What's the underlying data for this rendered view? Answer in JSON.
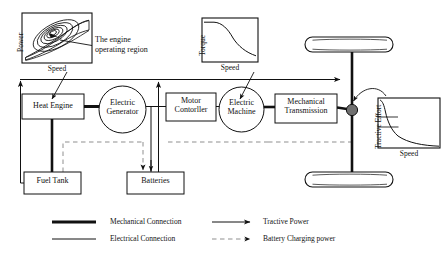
{
  "blocks": [
    {
      "id": "heat_engine",
      "label": "Heat Engine",
      "shape": "rect",
      "x": 22,
      "y": 94,
      "w": 62,
      "h": 25
    },
    {
      "id": "electric_generator",
      "label": "Electric\nGenerator",
      "shape": "circle",
      "x": 99,
      "y": 86,
      "w": 47,
      "h": 47
    },
    {
      "id": "motor_controller",
      "label": "Motor\nContorller",
      "shape": "rect",
      "x": 166,
      "y": 93,
      "w": 50,
      "h": 28
    },
    {
      "id": "electric_machine",
      "label": "Electric\nMachine",
      "shape": "circle",
      "x": 219,
      "y": 87,
      "w": 45,
      "h": 45
    },
    {
      "id": "mechanical_transmission",
      "label": "Mechanical\nTransmission",
      "shape": "rect",
      "x": 275,
      "y": 94,
      "w": 62,
      "h": 29
    },
    {
      "id": "fuel_tank",
      "label": "Fuel Tank",
      "shape": "rect",
      "x": 24,
      "y": 172,
      "w": 57,
      "h": 22
    },
    {
      "id": "batteries",
      "label": "Batteries",
      "shape": "rect",
      "x": 127,
      "y": 172,
      "w": 57,
      "h": 22
    }
  ],
  "block_labels": {
    "heat_engine": "Heat Engine",
    "electric_generator_line1": "Electric",
    "electric_generator_line2": "Generator",
    "motor_controller_line1": "Motor",
    "motor_controller_line2": "Contorller",
    "electric_machine_line1": "Electric",
    "electric_machine_line2": "Machine",
    "mechanical_transmission_line1": "Mechanical",
    "mechanical_transmission_line2": "Transmission",
    "fuel_tank": "Fuel Tank",
    "batteries": "Batteries"
  },
  "annotations": {
    "engine_region_line1": "The engine",
    "engine_region_line2": "operating region"
  },
  "charts": [
    {
      "id": "engine_map",
      "type": "contour",
      "title": "",
      "ylabel": "Power",
      "xlabel": "Speed",
      "description": "Engine power vs speed map with nested efficiency contour islands; arrow marks the engine operating region",
      "xlim": [
        0,
        1
      ],
      "ylim": [
        0,
        1
      ],
      "grid": false,
      "contours": [
        {
          "cx": 0.44,
          "cy": 0.56,
          "rx": 0.1,
          "ry": 0.075,
          "rot": -27
        },
        {
          "cx": 0.44,
          "cy": 0.56,
          "rx": 0.17,
          "ry": 0.125,
          "rot": -27
        },
        {
          "cx": 0.45,
          "cy": 0.55,
          "rx": 0.25,
          "ry": 0.175,
          "rot": -27
        },
        {
          "cx": 0.47,
          "cy": 0.53,
          "rx": 0.33,
          "ry": 0.235,
          "rot": -27
        },
        {
          "cx": 0.49,
          "cy": 0.5,
          "rx": 0.41,
          "ry": 0.295,
          "rot": -27
        }
      ],
      "envelope": [
        [
          0.05,
          0.12
        ],
        [
          0.3,
          0.52
        ],
        [
          0.58,
          0.76
        ],
        [
          0.82,
          0.84
        ],
        [
          0.95,
          0.8
        ],
        [
          0.95,
          0.22
        ],
        [
          0.55,
          0.16
        ],
        [
          0.05,
          0.12
        ]
      ]
    },
    {
      "id": "motor_torque",
      "type": "line",
      "title": "",
      "ylabel": "Torque",
      "xlabel": "Speed",
      "description": "Constant torque region followed by constant-power hyperbolic decay",
      "xlim": [
        0,
        1
      ],
      "ylim": [
        0,
        1
      ],
      "grid": false,
      "x": [
        0.0,
        0.1,
        0.18,
        0.26,
        0.36,
        0.46,
        0.58,
        0.7,
        0.84,
        1.0
      ],
      "y": [
        0.92,
        0.92,
        0.8,
        0.64,
        0.5,
        0.4,
        0.32,
        0.27,
        0.23,
        0.2
      ]
    },
    {
      "id": "tractive_effort",
      "type": "line",
      "title": "",
      "ylabel": "Tractive Effort",
      "xlabel": "Speed",
      "description": "Tractive effort vs vehicle speed, steep hyperbolic decay with two gear-ratio reference levels",
      "xlim": [
        0,
        1
      ],
      "ylim": [
        0,
        1
      ],
      "grid": false,
      "x": [
        0.02,
        0.06,
        0.1,
        0.16,
        0.24,
        0.34,
        0.46,
        0.6,
        0.76,
        1.0
      ],
      "y": [
        0.96,
        0.8,
        0.62,
        0.46,
        0.34,
        0.26,
        0.2,
        0.16,
        0.13,
        0.1
      ],
      "reference_levels": [
        0.62,
        0.44
      ]
    }
  ],
  "legend": {
    "items": [
      {
        "id": "mechanical_connection",
        "label": "Mechanical Connection",
        "style": "thick-solid",
        "arrow": false
      },
      {
        "id": "electrical_connection",
        "label": "Electrical Connection",
        "style": "thin-solid",
        "arrow": false
      },
      {
        "id": "tractive_power",
        "label": "Tractive Power",
        "style": "thin-solid",
        "arrow": true
      },
      {
        "id": "battery_charging",
        "label": "Battery Charging power",
        "style": "dashed",
        "arrow": true
      }
    ]
  },
  "colors": {
    "ink": "#111111",
    "line": "#1a1a1a",
    "dashed": "#8a8a8a",
    "background": "#ffffff",
    "node_fill": "#6f6f6f"
  }
}
